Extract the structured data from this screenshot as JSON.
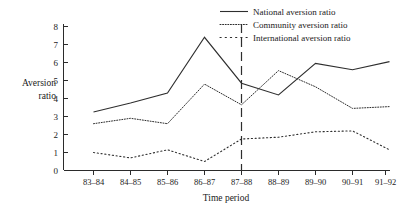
{
  "chart_data": {
    "type": "line",
    "title": "",
    "xlabel": "Time period",
    "ylabel": "Aversion ratio",
    "ylabel_line1": "Aversion",
    "ylabel_line2": "ratio",
    "categories": [
      "83–84",
      "84–85",
      "85–86",
      "86–87",
      "87–88",
      "88–89",
      "89–90",
      "90–91",
      "91–92"
    ],
    "ylim": [
      0,
      8
    ],
    "yticks": [
      0,
      1,
      2,
      3,
      4,
      5,
      6,
      7,
      8
    ],
    "ytick_labels": [
      "0",
      "1",
      "2",
      "3",
      "4",
      "5",
      "6",
      "7",
      "8"
    ],
    "grid": false,
    "legend_position": "top-right",
    "series": [
      {
        "name": "National aversion ratio",
        "style": "solid",
        "values": [
          3.25,
          3.75,
          4.3,
          7.4,
          4.85,
          4.2,
          5.95,
          5.6,
          6.05
        ]
      },
      {
        "name": "Community aversion ratio",
        "style": "fine-dotted",
        "values": [
          2.6,
          2.9,
          2.6,
          4.8,
          3.65,
          5.55,
          4.65,
          3.45,
          3.55
        ]
      },
      {
        "name": "International aversion ratio",
        "style": "coarse-dotted",
        "values": [
          1.0,
          0.7,
          1.15,
          0.5,
          1.75,
          1.85,
          2.15,
          2.2,
          1.15
        ]
      }
    ],
    "annotations": [
      {
        "name": "reference-line",
        "type": "vertical-dashed-line",
        "at_category": "87–88"
      }
    ],
    "colors": {
      "line": "#2e2e2e",
      "axis": "#2b2b2b",
      "background": "#ffffff"
    }
  }
}
